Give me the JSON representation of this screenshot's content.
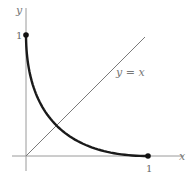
{
  "figure": {
    "axes": {
      "x_label": "x",
      "y_label": "y",
      "x_tick_label": "1",
      "y_tick_label": "1",
      "axis_color": "#9a9a9a"
    },
    "line_label": "y = x",
    "curve_color": "#1a1a1a",
    "line_color": "#7a7a7a",
    "points": [
      {
        "label": "(0, 1)",
        "x": 0,
        "y": 1
      },
      {
        "label": "(1, 0)",
        "x": 1,
        "y": 0
      }
    ]
  },
  "chart_data": {
    "type": "line",
    "title": "",
    "xlabel": "x",
    "ylabel": "y",
    "xlim": [
      -0.1,
      1.3
    ],
    "ylim": [
      -0.12,
      1.2
    ],
    "grid": false,
    "series": [
      {
        "name": "curve (√x + √y = 1)",
        "x": [
          0,
          0.0625,
          0.25,
          0.5625,
          1
        ],
        "y": [
          1,
          0.5625,
          0.25,
          0.0625,
          0
        ]
      },
      {
        "name": "y = x",
        "x": [
          0,
          0.98
        ],
        "y": [
          0,
          0.98
        ]
      }
    ],
    "annotations": [
      "y = x",
      "1 (y-axis)",
      "1 (x-axis)"
    ],
    "markers": [
      [
        0,
        1
      ],
      [
        1,
        0
      ]
    ]
  }
}
